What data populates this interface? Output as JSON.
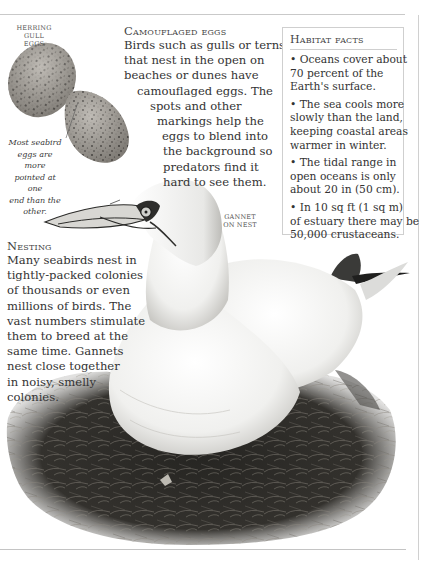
{
  "eggs_label": {
    "lines": [
      "Herring",
      "gull eggs"
    ]
  },
  "eggs_caption": {
    "lines": [
      "Most seabird",
      "eggs are more",
      "pointed at one",
      "end than the",
      "other."
    ]
  },
  "camouflaged_eggs": {
    "heading": "Camouflaged eggs",
    "lines": [
      "Birds such as gulls or terns",
      "that nest in the open on",
      "beaches or dunes have",
      "camouflaged eggs. The",
      "spots and other",
      "markings help the",
      "eggs to blend into",
      "the background so",
      "predators find it",
      "hard to see them."
    ]
  },
  "habitat_facts": {
    "heading": "Habitat facts",
    "facts": [
      {
        "lines": [
          "• Oceans cover about",
          "70 percent of the",
          "Earth's surface."
        ]
      },
      {
        "lines": [
          "• The sea cools more",
          "slowly than the land,",
          "keeping coastal areas",
          "warmer in winter."
        ]
      },
      {
        "lines": [
          "• The tidal range in",
          "open oceans is only",
          "about 20 in (50 cm)."
        ]
      },
      {
        "lines": [
          "• In 10 sq ft (1 sq m)",
          "of estuary there may be",
          "50,000 crustaceans."
        ]
      }
    ]
  },
  "gannet_label": {
    "lines": [
      "Gannet",
      "on nest"
    ]
  },
  "nesting": {
    "heading": "Nesting",
    "lines": [
      "Many seabirds nest in",
      "tightly-packed colonies",
      "of thousands or even",
      "millions of birds. The",
      "vast numbers stimulate",
      "them to breed at the",
      "same time. Gannets",
      "nest close together",
      "in noisy, smelly",
      "colonies."
    ]
  },
  "colors": {
    "rule": "#c9c9c9",
    "text": "#333333",
    "egg": "#a9a49c",
    "nest": "#2b2b28"
  }
}
